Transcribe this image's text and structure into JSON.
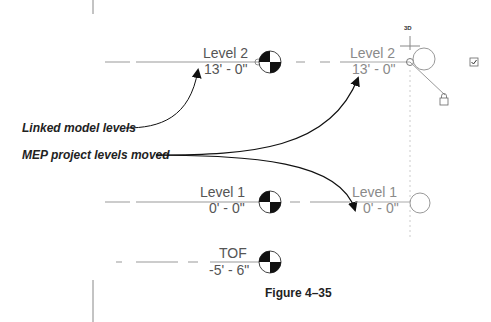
{
  "diagram": {
    "caption": "Figure 4–35",
    "callouts": {
      "linked": "Linked model levels",
      "moved": "MEP project levels moved"
    },
    "view_label": "3D",
    "levels_linked": [
      {
        "name": "Level 2",
        "elevation": "13' - 0\""
      },
      {
        "name": "Level 1",
        "elevation": "0' - 0\""
      },
      {
        "name": "TOF",
        "elevation": "-5' - 6\""
      }
    ],
    "levels_project": [
      {
        "name": "Level 2",
        "elevation": "13' - 0\""
      },
      {
        "name": "Level 1",
        "elevation": "0' - 0\""
      }
    ],
    "icons": [
      "level-head-icon",
      "lock-icon",
      "checkbox-icon",
      "crosshair-icon"
    ]
  }
}
